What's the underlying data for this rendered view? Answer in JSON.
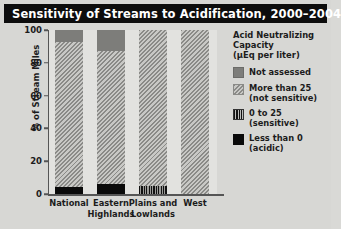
{
  "title": "Sensitivity of Streams to Acidification, 2000–2004",
  "axes": {
    "ylabel": "% of Stream Miles",
    "yticks": [
      "100",
      "80",
      "60",
      "40",
      "20",
      "0"
    ]
  },
  "legend": {
    "title_line1": "Acid Neutralizing",
    "title_line2": "Capacity",
    "title_line3": "(µEq per liter)",
    "items": [
      {
        "label": "Not assessed",
        "sub": "",
        "key": "notassessed",
        "color": "#7d7d7a"
      },
      {
        "label": "More than 25",
        "sub": "(not sensitive)",
        "key": "morethan25",
        "color": "#8a8a87"
      },
      {
        "label": "0 to 25",
        "sub": "(sensitive)",
        "key": "zeroto25",
        "color": "#111111"
      },
      {
        "label": "Less than 0",
        "sub": "(acidic)",
        "key": "lessthan0",
        "color": "#0a0a0a"
      }
    ]
  },
  "chart_data": {
    "type": "bar",
    "subtype": "stacked-bar",
    "title": "Sensitivity of Streams to Acidification, 2000–2004",
    "xlabel": "",
    "ylabel": "% of Stream Miles",
    "ylim": [
      0,
      100
    ],
    "yticks": [
      0,
      20,
      40,
      60,
      80,
      100
    ],
    "grid": false,
    "legend_position": "right",
    "legend_title": "Acid Neutralizing Capacity (µEq per liter)",
    "categories": [
      "National",
      "Eastern Highlands",
      "Plains and Lowlands",
      "West"
    ],
    "category_labels": [
      [
        "National"
      ],
      [
        "Eastern",
        "Highlands"
      ],
      [
        "Plains and",
        "Lowlands"
      ],
      [
        "West"
      ]
    ],
    "series": [
      {
        "name": "Not assessed",
        "key": "notassessed",
        "values": [
          7,
          13,
          0,
          0
        ]
      },
      {
        "name": "More than 25 (not sensitive)",
        "key": "morethan25",
        "values": [
          89,
          81,
          95,
          100
        ]
      },
      {
        "name": "0 to 25 (sensitive)",
        "key": "zeroto25",
        "values": [
          0,
          0,
          5,
          0
        ]
      },
      {
        "name": "Less than 0 (acidic)",
        "key": "lessthan0",
        "values": [
          4,
          6,
          0,
          0
        ]
      }
    ],
    "stack_order_top_to_bottom": [
      "notassessed",
      "morethan25",
      "zeroto25",
      "lessthan0"
    ]
  }
}
